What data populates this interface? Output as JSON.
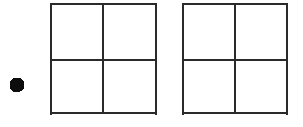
{
  "figure": {
    "background_color": "#ffffff",
    "width": 303,
    "height": 127
  },
  "palette": {
    "ink": "#2b2b2b",
    "ink_dark": "#1a1a1a",
    "dot_fill": "#111111",
    "background": "#ffffff"
  },
  "shapes": {
    "bullet_dot": {
      "name": "solid-dot",
      "label": "dot",
      "cx": 17,
      "cy": 85,
      "r": 7.5,
      "fill": "#111111"
    },
    "squares": [
      {
        "name": "left-square",
        "label": "Left square",
        "x": 50,
        "y": 3.5,
        "width": 107,
        "height": 111,
        "cross_x": 103,
        "cross_y": 60,
        "stroke": "#2b2b2b",
        "stroke_width": 2,
        "cells": [
          "top-left",
          "top-right",
          "bottom-left",
          "bottom-right"
        ]
      },
      {
        "name": "right-square",
        "label": "Right square",
        "x": 182,
        "y": 3.5,
        "width": 106,
        "height": 111,
        "cross_x": 235,
        "cross_y": 60,
        "stroke": "#2b2b2b",
        "stroke_width": 2,
        "cells": [
          "top-left",
          "top-right",
          "bottom-left",
          "bottom-right"
        ]
      }
    ]
  },
  "accessibility": {
    "description": "Line drawing: a filled black dot at the left, then two equal squares, each divided into four quadrants by one vertical and one horizontal line through the center."
  }
}
